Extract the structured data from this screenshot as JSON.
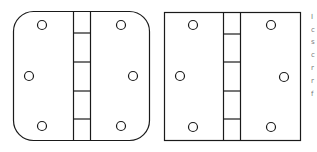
{
  "figure": {
    "hinges": [
      {
        "name": "rounded-corner-hinge",
        "corner_style": "rounded",
        "screw_holes": 6,
        "knuckle_segments": 5
      },
      {
        "name": "square-corner-hinge",
        "corner_style": "square",
        "screw_holes": 6,
        "knuckle_segments": 5
      }
    ],
    "stroke_color": "#1a1a1a",
    "background_color": "#ffffff"
  },
  "cropped_text_fragments": [
    "I",
    "c",
    "s",
    "c",
    "r",
    "r",
    "f"
  ]
}
